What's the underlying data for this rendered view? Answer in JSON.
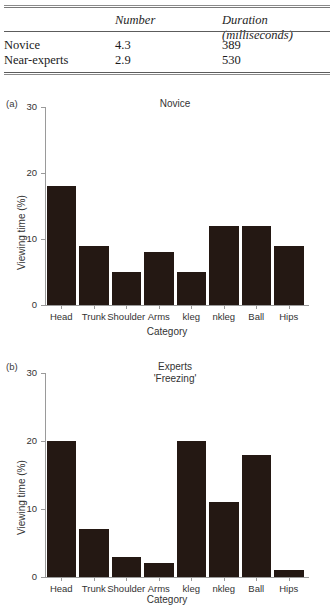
{
  "table": {
    "headers": [
      "",
      "Number",
      "Duration (milliseconds)"
    ],
    "rows": [
      {
        "label": "Novice",
        "number": "4.3",
        "duration": "389"
      },
      {
        "label": "Near-experts",
        "number": "2.9",
        "duration": "530"
      }
    ]
  },
  "panel_a": {
    "letter": "(a)",
    "title": "Novice"
  },
  "panel_b": {
    "letter": "(b)",
    "title_line1": "Experts",
    "title_line2": "'Freezing'"
  },
  "axis": {
    "ylabel": "Viewing time (%)",
    "xlabel": "Category",
    "yticks": [
      "0",
      "10",
      "20",
      "30"
    ]
  },
  "colors": {
    "bar_fill": "#241813",
    "axis": "#9a9a9a",
    "text": "#333333"
  },
  "chart_data": [
    {
      "type": "bar",
      "title": "Novice",
      "panel": "(a)",
      "categories": [
        "Head",
        "Trunk",
        "Shoulder",
        "Arms",
        "kleg",
        "nkleg",
        "Ball",
        "Hips"
      ],
      "values": [
        18,
        9,
        5,
        8,
        5,
        12,
        12,
        9
      ],
      "xlabel": "Category",
      "ylabel": "Viewing time (%)",
      "ylim": [
        0,
        30
      ],
      "yticks": [
        0,
        10,
        20,
        30
      ],
      "grid": false,
      "legend": null
    },
    {
      "type": "bar",
      "title": "Experts 'Freezing'",
      "panel": "(b)",
      "categories": [
        "Head",
        "Trunk",
        "Shoulder",
        "Arms",
        "kleg",
        "nkleg",
        "Ball",
        "Hips"
      ],
      "values": [
        20,
        7,
        3,
        2,
        20,
        11,
        18,
        1
      ],
      "xlabel": "Category",
      "ylabel": "Viewing time (%)",
      "ylim": [
        0,
        30
      ],
      "yticks": [
        0,
        10,
        20,
        30
      ],
      "grid": false,
      "legend": null
    }
  ]
}
